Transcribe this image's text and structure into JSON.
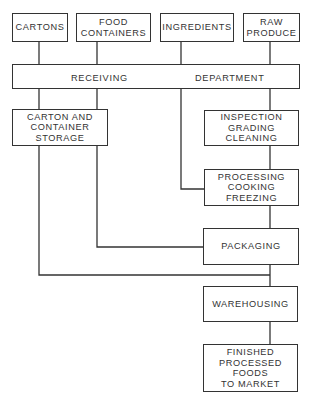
{
  "diagram": {
    "type": "flowchart",
    "colors": {
      "line": "#333333",
      "background": "#ffffff",
      "text": "#333333"
    },
    "sources": [
      {
        "id": "cartons",
        "lines": [
          "CARTONS"
        ]
      },
      {
        "id": "food_containers",
        "lines": [
          "FOOD",
          "CONTAINERS"
        ]
      },
      {
        "id": "ingredients",
        "lines": [
          "INGREDIENTS"
        ]
      },
      {
        "id": "raw_produce",
        "lines": [
          "RAW",
          "PRODUCE"
        ]
      }
    ],
    "receiving": {
      "left": "RECEIVING",
      "right": "DEPARTMENT"
    },
    "storage": {
      "lines": [
        "CARTON AND",
        "CONTAINER",
        "STORAGE"
      ]
    },
    "inspection": {
      "lines": [
        "INSPECTION",
        "GRADING",
        "CLEANING"
      ]
    },
    "processing": {
      "lines": [
        "PROCESSING",
        "COOKING",
        "FREEZING"
      ]
    },
    "packaging": {
      "lines": [
        "PACKAGING"
      ]
    },
    "warehousing": {
      "lines": [
        "WAREHOUSING"
      ]
    },
    "finished": {
      "lines": [
        "FINISHED",
        "PROCESSED",
        "FOODS",
        "TO MARKET"
      ]
    },
    "edges": [
      [
        "CARTONS",
        "RECEIVING DEPARTMENT"
      ],
      [
        "FOOD CONTAINERS",
        "RECEIVING DEPARTMENT"
      ],
      [
        "INGREDIENTS",
        "RECEIVING DEPARTMENT"
      ],
      [
        "RAW PRODUCE",
        "RECEIVING DEPARTMENT"
      ],
      [
        "RECEIVING DEPARTMENT",
        "CARTON AND CONTAINER STORAGE"
      ],
      [
        "RECEIVING DEPARTMENT",
        "INSPECTION GRADING CLEANING"
      ],
      [
        "RECEIVING DEPARTMENT",
        "PROCESSING COOKING FREEZING"
      ],
      [
        "INSPECTION GRADING CLEANING",
        "PROCESSING COOKING FREEZING"
      ],
      [
        "PROCESSING COOKING FREEZING",
        "PACKAGING"
      ],
      [
        "CARTON AND CONTAINER STORAGE",
        "PACKAGING"
      ],
      [
        "CARTON AND CONTAINER STORAGE",
        "WAREHOUSING"
      ],
      [
        "PACKAGING",
        "WAREHOUSING"
      ],
      [
        "WAREHOUSING",
        "FINISHED PROCESSED FOODS TO MARKET"
      ]
    ]
  }
}
